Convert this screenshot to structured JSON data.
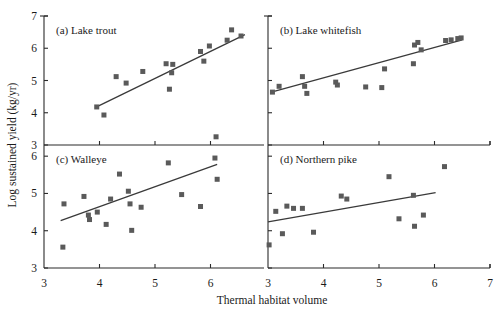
{
  "figure": {
    "xlabel": "Thermal habitat volume",
    "ylabel": "Log sustained yield (kg/yr)",
    "marker_color": "#5a5a5a",
    "line_color": "#3a3a3a",
    "axis_color": "#2b2b2b"
  },
  "chart_data": [
    {
      "type": "scatter",
      "panel": "a",
      "title": "(a) Lake trout",
      "xlabel": "Thermal habitat volume",
      "ylabel": "Log sustained yield (kg/yr)",
      "xlim": [
        3,
        7
      ],
      "ylim": [
        3,
        7
      ],
      "xticks": [
        3,
        4,
        5,
        6
      ],
      "yticks": [
        3,
        4,
        5,
        6,
        7
      ],
      "grid": false,
      "legend": "none",
      "points": [
        {
          "x": 3.95,
          "y": 4.18
        },
        {
          "x": 4.08,
          "y": 3.93
        },
        {
          "x": 4.3,
          "y": 5.12
        },
        {
          "x": 4.48,
          "y": 4.92
        },
        {
          "x": 4.78,
          "y": 5.28
        },
        {
          "x": 5.2,
          "y": 5.52
        },
        {
          "x": 5.32,
          "y": 5.5
        },
        {
          "x": 5.3,
          "y": 5.24
        },
        {
          "x": 5.26,
          "y": 4.73
        },
        {
          "x": 5.82,
          "y": 5.9
        },
        {
          "x": 5.88,
          "y": 5.6
        },
        {
          "x": 5.98,
          "y": 6.07
        },
        {
          "x": 6.3,
          "y": 6.25
        },
        {
          "x": 6.38,
          "y": 6.57
        },
        {
          "x": 6.55,
          "y": 6.38
        }
      ],
      "fit_line": {
        "x0": 3.92,
        "y0": 4.16,
        "x1": 6.62,
        "y1": 6.42
      }
    },
    {
      "type": "scatter",
      "panel": "b",
      "title": "(b) Lake whitefish",
      "xlabel": "Thermal habitat volume",
      "ylabel": "Log sustained yield (kg/yr)",
      "xlim": [
        3,
        7
      ],
      "ylim": [
        3,
        7
      ],
      "xticks": [
        3,
        4,
        5,
        6,
        7
      ],
      "yticks": [
        3,
        4,
        5,
        6,
        7
      ],
      "grid": false,
      "legend": "none",
      "points": [
        {
          "x": 3.08,
          "y": 4.64
        },
        {
          "x": 3.2,
          "y": 4.82
        },
        {
          "x": 3.62,
          "y": 5.12
        },
        {
          "x": 3.66,
          "y": 4.82
        },
        {
          "x": 3.7,
          "y": 4.6
        },
        {
          "x": 4.22,
          "y": 4.95
        },
        {
          "x": 4.25,
          "y": 4.86
        },
        {
          "x": 4.76,
          "y": 4.8
        },
        {
          "x": 5.05,
          "y": 4.78
        },
        {
          "x": 5.1,
          "y": 5.36
        },
        {
          "x": 5.62,
          "y": 5.52
        },
        {
          "x": 5.64,
          "y": 6.1
        },
        {
          "x": 5.7,
          "y": 6.18
        },
        {
          "x": 5.76,
          "y": 5.95
        },
        {
          "x": 6.2,
          "y": 6.24
        },
        {
          "x": 6.3,
          "y": 6.26
        },
        {
          "x": 6.42,
          "y": 6.3
        },
        {
          "x": 6.48,
          "y": 6.32
        }
      ],
      "fit_line": {
        "x0": 3.06,
        "y0": 4.64,
        "x1": 6.5,
        "y1": 6.26
      }
    },
    {
      "type": "scatter",
      "panel": "c",
      "title": "(c) Walleye",
      "xlabel": "Thermal habitat volume",
      "ylabel": "Log sustained yield (kg/yr)",
      "xlim": [
        3,
        7
      ],
      "ylim": [
        3,
        7
      ],
      "xticks": [
        3,
        4,
        5,
        6
      ],
      "yticks": [
        3,
        4,
        5,
        6
      ],
      "grid": false,
      "legend": "none",
      "points": [
        {
          "x": 3.34,
          "y": 3.56
        },
        {
          "x": 3.36,
          "y": 4.72
        },
        {
          "x": 3.72,
          "y": 4.92
        },
        {
          "x": 3.8,
          "y": 4.42
        },
        {
          "x": 3.82,
          "y": 4.3
        },
        {
          "x": 3.96,
          "y": 4.5
        },
        {
          "x": 4.12,
          "y": 4.17
        },
        {
          "x": 4.2,
          "y": 4.85
        },
        {
          "x": 4.36,
          "y": 5.52
        },
        {
          "x": 4.52,
          "y": 5.06
        },
        {
          "x": 4.55,
          "y": 4.72
        },
        {
          "x": 4.58,
          "y": 4.01
        },
        {
          "x": 4.75,
          "y": 4.63
        },
        {
          "x": 5.24,
          "y": 5.82
        },
        {
          "x": 5.48,
          "y": 4.97
        },
        {
          "x": 5.82,
          "y": 4.65
        },
        {
          "x": 6.08,
          "y": 5.95
        },
        {
          "x": 6.1,
          "y": 6.52
        },
        {
          "x": 6.12,
          "y": 5.38
        }
      ],
      "fit_line": {
        "x0": 3.3,
        "y0": 4.27,
        "x1": 6.12,
        "y1": 5.78
      }
    },
    {
      "type": "scatter",
      "panel": "d",
      "title": "(d) Northern pike",
      "xlabel": "Thermal habitat volume",
      "ylabel": "Log sustained yield (kg/yr)",
      "xlim": [
        3,
        7
      ],
      "ylim": [
        3,
        7
      ],
      "xticks": [
        3,
        4,
        5,
        6,
        7
      ],
      "yticks": [
        3,
        4,
        5,
        6
      ],
      "grid": false,
      "legend": "none",
      "points": [
        {
          "x": 3.02,
          "y": 3.62
        },
        {
          "x": 3.14,
          "y": 4.52
        },
        {
          "x": 3.26,
          "y": 3.92
        },
        {
          "x": 3.34,
          "y": 4.66
        },
        {
          "x": 3.46,
          "y": 4.6
        },
        {
          "x": 3.62,
          "y": 4.6
        },
        {
          "x": 3.82,
          "y": 3.96
        },
        {
          "x": 4.32,
          "y": 4.93
        },
        {
          "x": 4.42,
          "y": 4.85
        },
        {
          "x": 5.18,
          "y": 5.45
        },
        {
          "x": 5.36,
          "y": 4.32
        },
        {
          "x": 5.62,
          "y": 4.95
        },
        {
          "x": 5.64,
          "y": 4.12
        },
        {
          "x": 5.8,
          "y": 4.42
        },
        {
          "x": 6.18,
          "y": 5.72
        }
      ],
      "fit_line": {
        "x0": 3.0,
        "y0": 4.24,
        "x1": 6.02,
        "y1": 5.02
      }
    }
  ],
  "panel_labels": {
    "a": "(a) Lake trout",
    "b": "(b) Lake whitefish",
    "c": "(c) Walleye",
    "d": "(d) Northern pike"
  },
  "axis_tick_text": {
    "left_top": [
      "7",
      "6",
      "5",
      "4",
      "3"
    ],
    "left_bottom": [
      "6",
      "5",
      "4",
      "3"
    ],
    "bottom_left": [
      "3",
      "4",
      "5",
      "6"
    ],
    "bottom_right": [
      "3",
      "4",
      "5",
      "6",
      "7"
    ]
  }
}
